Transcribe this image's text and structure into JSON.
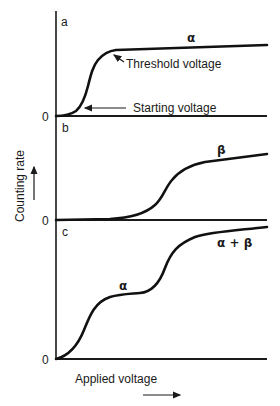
{
  "figure": {
    "y_axis_label": "Counting rate",
    "x_axis_label": "Applied voltage",
    "panels": [
      {
        "id": "a",
        "label": "a",
        "zero_label": "0",
        "curve_label": "α",
        "annotations": [
          {
            "text": "Threshold voltage"
          },
          {
            "text": "Starting voltage"
          }
        ]
      },
      {
        "id": "b",
        "label": "b",
        "zero_label": "0",
        "curve_label": "β"
      },
      {
        "id": "c",
        "label": "c",
        "zero_label": "0",
        "curve_labels": [
          "α",
          "α + β"
        ]
      }
    ],
    "colors": {
      "ink": "#111111",
      "background": "#ffffff"
    }
  }
}
